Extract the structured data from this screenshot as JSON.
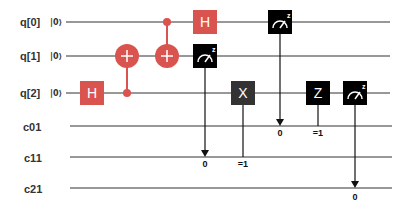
{
  "circuit": {
    "qubits": [
      {
        "label": "q[0]",
        "init": "|0⟩"
      },
      {
        "label": "q[1]",
        "init": "|0⟩"
      },
      {
        "label": "q[2]",
        "init": "|0⟩"
      }
    ],
    "classical": [
      {
        "label": "c01"
      },
      {
        "label": "c11"
      },
      {
        "label": "c21"
      }
    ],
    "gates": [
      {
        "type": "H",
        "label": "H",
        "qubit": 2
      },
      {
        "type": "CNOT",
        "control": 2,
        "target": 1
      },
      {
        "type": "CNOT",
        "control": 0,
        "target": 1
      },
      {
        "type": "H",
        "label": "H",
        "qubit": 0
      },
      {
        "type": "measure",
        "qubit": 1,
        "classical": 1,
        "result": "0"
      },
      {
        "type": "X",
        "label": "X",
        "qubit": 2,
        "condition_reg": 1,
        "condition": "=1"
      },
      {
        "type": "measure",
        "qubit": 0,
        "classical": 0,
        "result": "0"
      },
      {
        "type": "Z",
        "label": "Z",
        "qubit": 2,
        "condition_reg": 0,
        "condition": "=1"
      },
      {
        "type": "measure",
        "qubit": 2,
        "classical": 2,
        "result": "0"
      }
    ],
    "measure_basis_label": "z",
    "colors": {
      "h_gate": "#d9534f",
      "cnot": "#d9534f",
      "dark_gate": "#000000",
      "wire": "#333333"
    }
  }
}
